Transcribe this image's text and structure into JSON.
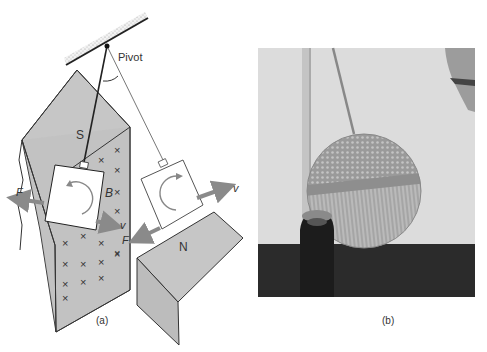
{
  "figure": {
    "panel_a": {
      "caption": "(a)",
      "labels": {
        "pivot": "Pivot",
        "south_pole": "S",
        "north_pole": "N",
        "magnetic_field": "B",
        "force_left": "F",
        "velocity_left": "v",
        "force_right": "F",
        "velocity_right": "v"
      },
      "field_marker": "×"
    },
    "panel_b": {
      "caption": "(b)"
    },
    "colors": {
      "magnet_face": "#c8c8c8",
      "magnet_side": "#b4b4b4",
      "arrow": "#8a8a8a",
      "line": "#222222",
      "photo_wall": "#d9d9d9",
      "photo_floor": "#2a2a2a",
      "disc": "#a8a8a8"
    }
  }
}
